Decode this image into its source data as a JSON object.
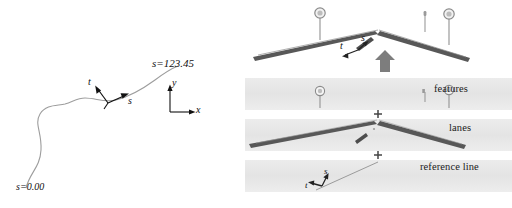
{
  "figure": {
    "background_color": "#ffffff"
  },
  "left_panel": {
    "name": "reference-line-curve",
    "curve_color": "#9a9a9a",
    "arrow_color": "#111111",
    "labels": {
      "s_start": "s=0.00",
      "s_end": "s=123.45",
      "tangent": "s",
      "normal": "t",
      "axis_x": "x",
      "axis_y": "y"
    }
  },
  "right_panel": {
    "name": "layered-road-map",
    "scene": {
      "lane_color": "#4a4a4a",
      "pole_color": "#8a8a8a",
      "arrow_color": "#777777",
      "labels": {
        "tangent": "s",
        "normal": "t"
      },
      "signs": [
        {
          "type": "round-sign",
          "label": "80"
        },
        {
          "type": "round-sign",
          "label": "80"
        },
        {
          "type": "post-marker",
          "label": ""
        }
      ]
    },
    "bands": [
      {
        "id": "features",
        "label": "features",
        "fill": "#e8e8e8"
      },
      {
        "id": "lanes",
        "label": "lanes",
        "fill": "#e8e8e8"
      },
      {
        "id": "reference-line",
        "label": "reference line",
        "fill": "#e8e8e8"
      }
    ],
    "operators": [
      {
        "symbol": "+"
      },
      {
        "symbol": "+"
      }
    ],
    "reference_band_labels": {
      "tangent": "s",
      "normal": "t"
    }
  }
}
